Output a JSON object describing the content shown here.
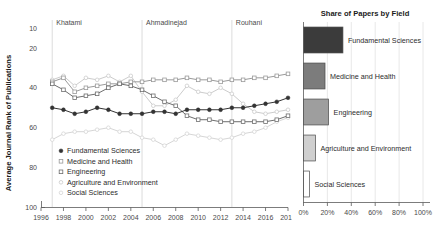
{
  "chart_data": [
    {
      "type": "line",
      "id": "journal-rank-trend",
      "title": "",
      "xlabel": "",
      "ylabel": "Average Journal Rank of Publications",
      "xlim": [
        1996,
        2018
      ],
      "ylim": [
        100,
        5
      ],
      "y_inverted": true,
      "grid": false,
      "legend_position": "bottom-left",
      "xticks": [
        1996,
        1998,
        2000,
        2002,
        2004,
        2006,
        2008,
        2010,
        2012,
        2014,
        2016,
        2018
      ],
      "xtick_labels": [
        "1996",
        "1998",
        "2000",
        "2002",
        "2004",
        "2006",
        "2008",
        "2010",
        "2012",
        "2014",
        "2016",
        "2018"
      ],
      "yticks": [
        10,
        20,
        40,
        60,
        80,
        100
      ],
      "ytick_labels": [
        "10",
        "20",
        "40",
        "60",
        "80",
        "100"
      ],
      "annotations": [
        {
          "label": "Khatami",
          "x": 1997
        },
        {
          "label": "Ahmadinejad",
          "x": 2005
        },
        {
          "label": "Rouhani",
          "x": 2013
        }
      ],
      "x": [
        1997,
        1998,
        1999,
        2000,
        2001,
        2002,
        2003,
        2004,
        2005,
        2006,
        2007,
        2008,
        2009,
        2010,
        2011,
        2012,
        2013,
        2014,
        2015,
        2016,
        2017,
        2018
      ],
      "series": [
        {
          "name": "Fundamental Sciences",
          "marker": "filled-circle",
          "color": "#333333",
          "values": [
            50,
            51,
            53,
            52,
            50,
            51,
            53,
            53,
            53,
            52,
            52,
            53,
            51,
            51,
            51,
            51,
            50,
            50,
            49,
            48,
            47,
            45
          ]
        },
        {
          "name": "Medicine and Health",
          "marker": "open-square",
          "color": "#9a9a9a",
          "values": [
            37,
            35,
            42,
            40,
            39,
            38,
            38,
            37,
            37,
            36,
            36,
            36,
            35,
            36,
            36,
            37,
            36,
            36,
            35,
            35,
            34,
            33
          ]
        },
        {
          "name": "Engineering",
          "marker": "open-square",
          "color": "#6e6e6e",
          "values": [
            38,
            41,
            45,
            44,
            43,
            40,
            38,
            39,
            41,
            44,
            47,
            49,
            54,
            56,
            56,
            57,
            57,
            57,
            57,
            57,
            56,
            54
          ]
        },
        {
          "name": "Agriculture and Environment",
          "marker": "open-circle",
          "color": "#cccccc",
          "values": [
            36,
            34,
            39,
            35,
            36,
            34,
            37,
            34,
            42,
            49,
            49,
            46,
            39,
            42,
            43,
            40,
            43,
            48,
            52,
            53,
            52,
            51
          ]
        },
        {
          "name": "Social Sciences",
          "marker": "open-circle",
          "color": "#d6d6d6",
          "values": [
            66,
            63,
            62,
            62,
            61,
            60,
            62,
            62,
            65,
            66,
            69,
            66,
            63,
            64,
            65,
            66,
            65,
            63,
            62,
            60,
            57,
            55
          ]
        }
      ]
    },
    {
      "type": "bar",
      "id": "share-of-papers",
      "orientation": "horizontal",
      "title": "Share of Papers by Field",
      "xlabel": "",
      "ylabel": "",
      "xlim": [
        0,
        100
      ],
      "grid": true,
      "legend_position": "none",
      "xticks": [
        0,
        20,
        40,
        60,
        80,
        100
      ],
      "xtick_labels": [
        "0%",
        "20%",
        "40%",
        "60%",
        "80%",
        "100%"
      ],
      "categories": [
        "Fundamental Sciences",
        "Medicine and Health",
        "Engineering",
        "Agriculture and Environment",
        "Social Sciences"
      ],
      "values": [
        33,
        18,
        21,
        10,
        5
      ],
      "colors": [
        "#3b3b3b",
        "#7c7c7c",
        "#9e9e9e",
        "#cfcfcf",
        "#ffffff"
      ]
    }
  ],
  "line_chart": {
    "ylabel": "Average Journal Rank of Publications",
    "eras": [
      {
        "label": "Khatami"
      },
      {
        "label": "Ahmadinejad"
      },
      {
        "label": "Rouhani"
      }
    ],
    "ytick_labels": [
      "10",
      "20",
      "40",
      "60",
      "80",
      "100"
    ],
    "xtick_labels": [
      "1996",
      "1998",
      "2000",
      "2002",
      "2004",
      "2006",
      "2008",
      "2010",
      "2012",
      "2014",
      "2016",
      "2018"
    ],
    "legend": [
      {
        "label": "Fundamental Sciences"
      },
      {
        "label": "Medicine and Health"
      },
      {
        "label": "Engineering"
      },
      {
        "label": "Agriculture and Environment"
      },
      {
        "label": "Social Sciences"
      }
    ]
  },
  "bar_chart": {
    "title": "Share of Papers by Field",
    "xtick_labels": [
      "0%",
      "20%",
      "40%",
      "60%",
      "80%",
      "100%"
    ],
    "bars": [
      {
        "label": "Fundamental Sciences"
      },
      {
        "label": "Medicine and Health"
      },
      {
        "label": "Engineering"
      },
      {
        "label": "Agriculture and Environment"
      },
      {
        "label": "Social Sciences"
      }
    ]
  }
}
